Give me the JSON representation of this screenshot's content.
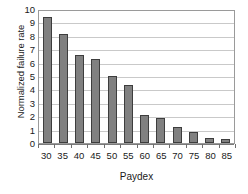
{
  "chart_data": {
    "type": "bar",
    "title": "",
    "subtitle": "",
    "xlabel": "Paydex",
    "ylabel": "Normalized failure rate",
    "categories": [
      "30",
      "35",
      "40",
      "45",
      "50",
      "55",
      "60",
      "65",
      "70",
      "75",
      "80",
      "85"
    ],
    "values": [
      9.4,
      8.1,
      6.55,
      6.25,
      5.0,
      4.3,
      2.1,
      1.85,
      1.2,
      0.8,
      0.4,
      0.3
    ],
    "series": [
      {
        "name": "Normalized failure rate",
        "values": [
          9.4,
          8.1,
          6.55,
          6.25,
          5.0,
          4.3,
          2.1,
          1.85,
          1.2,
          0.8,
          0.4,
          0.3
        ]
      }
    ],
    "ylim": [
      0,
      10
    ],
    "ytick_labels": [
      "0",
      "1",
      "2",
      "3",
      "4",
      "5",
      "6",
      "7",
      "8",
      "9",
      "10"
    ],
    "ytick_values": [
      0,
      1,
      2,
      3,
      4,
      5,
      6,
      7,
      8,
      9,
      10
    ],
    "xtick_labels": [
      "30",
      "35",
      "40",
      "45",
      "50",
      "55",
      "60",
      "65",
      "70",
      "75",
      "80",
      "85"
    ],
    "grid": true,
    "grid_axis": "y",
    "legend": false,
    "legend_position": "none",
    "annotations": [],
    "colors": {
      "bar_fill": "#808080",
      "bar_border": "#3d3d3d",
      "gridline": "#c9c9c9",
      "axis_line": "#9a9a9a",
      "plot_background": "#ffffff",
      "text": "#1a1a1a"
    }
  }
}
